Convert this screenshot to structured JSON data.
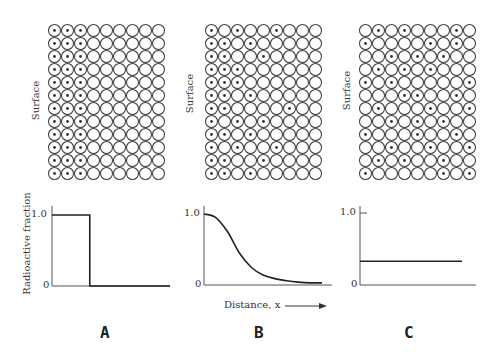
{
  "diagram": {
    "grid": {
      "rows": 12,
      "cols": 9,
      "cell_px": 13.0
    },
    "surface_label": "Surface",
    "panels": [
      {
        "id": "A",
        "letter": "A",
        "grid_origin": [
          48,
          24
        ],
        "radioactive_cells_by_row": [
          [
            1,
            2,
            3
          ],
          [
            1,
            2,
            3
          ],
          [
            1,
            2,
            3
          ],
          [
            1,
            2,
            3
          ],
          [
            1,
            2,
            3
          ],
          [
            1,
            2,
            3
          ],
          [
            1,
            2,
            3
          ],
          [
            1,
            2,
            3
          ],
          [
            1,
            2,
            3
          ],
          [
            1,
            2,
            3
          ],
          [
            1,
            2,
            3
          ],
          [
            1,
            2,
            3
          ]
        ]
      },
      {
        "id": "B",
        "letter": "B",
        "grid_origin": [
          205,
          24
        ],
        "radioactive_cells_by_row": [
          [
            1,
            3,
            6
          ],
          [
            1,
            2,
            4
          ],
          [
            1,
            2,
            5
          ],
          [
            1,
            2,
            3
          ],
          [
            1,
            2,
            3
          ],
          [
            1,
            2,
            4
          ],
          [
            1,
            2,
            7
          ],
          [
            1,
            3,
            5
          ],
          [
            1,
            2,
            4
          ],
          [
            1,
            3,
            6
          ],
          [
            1,
            2,
            5
          ],
          [
            1,
            2,
            4
          ]
        ]
      },
      {
        "id": "C",
        "letter": "C",
        "grid_origin": [
          359,
          24
        ],
        "radioactive_cells_by_row": [
          [
            2,
            4,
            8
          ],
          [
            1,
            6,
            8
          ],
          [
            3,
            5,
            7
          ],
          [
            2,
            4,
            6
          ],
          [
            1,
            3,
            9
          ],
          [
            4,
            5,
            8
          ],
          [
            2,
            6,
            9
          ],
          [
            3,
            5,
            7
          ],
          [
            1,
            5,
            8
          ],
          [
            3,
            6,
            9
          ],
          [
            2,
            4,
            7
          ],
          [
            1,
            7,
            9
          ]
        ]
      }
    ],
    "y_axis_label": "Radioactive fraction",
    "x_axis_label": "Distance, x",
    "x_axis_arrow": "→"
  },
  "chart_data": [
    {
      "type": "line",
      "panel": "A",
      "title": "",
      "xlabel": "",
      "ylabel": "Radioactive fraction",
      "yticks": [
        "0",
        "1.0"
      ],
      "ylim": [
        0,
        1.0
      ],
      "x": [
        0,
        0.32,
        0.32,
        1.0
      ],
      "values": [
        1.0,
        1.0,
        0,
        0
      ],
      "description": "Step function: fraction 1.0 near surface, dropping to 0 at ~1/3 of distance"
    },
    {
      "type": "line",
      "panel": "B",
      "title": "",
      "xlabel": "Distance, x",
      "ylabel": "",
      "yticks": [
        "0",
        "1.0"
      ],
      "ylim": [
        0,
        1.0
      ],
      "x": [
        0,
        0.1,
        0.2,
        0.3,
        0.4,
        0.5,
        0.6,
        0.7,
        0.8,
        0.9,
        1.0
      ],
      "values": [
        1.0,
        0.95,
        0.75,
        0.45,
        0.25,
        0.14,
        0.09,
        0.06,
        0.04,
        0.03,
        0.03
      ],
      "description": "Sigmoidal decay (error-function-like diffusion profile)"
    },
    {
      "type": "line",
      "panel": "C",
      "title": "",
      "xlabel": "",
      "ylabel": "",
      "yticks": [
        "0",
        "1.0"
      ],
      "ylim": [
        0,
        1.0
      ],
      "x": [
        0,
        1.0
      ],
      "values": [
        0.33,
        0.33
      ],
      "description": "Uniform fraction ~1/3 across distance"
    }
  ]
}
